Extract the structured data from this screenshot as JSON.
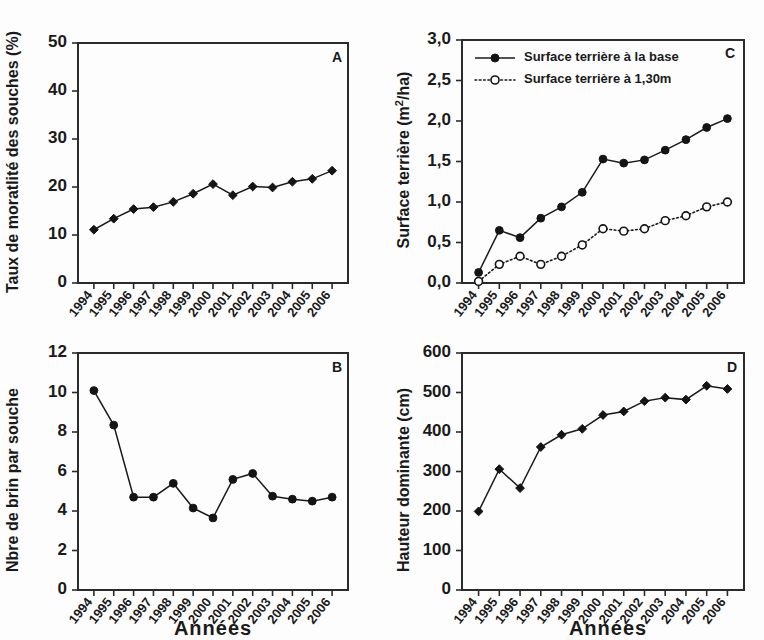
{
  "figure": {
    "width": 764,
    "height": 640,
    "background": "#ffffff",
    "ink_color": "#1a1a1a",
    "xaxis_title": "Années",
    "xaxis_title_2": "Années"
  },
  "chart_data": [
    {
      "id": "A",
      "panel_letter": "A",
      "type": "line",
      "title": "",
      "xlabel": "Années",
      "ylabel": "Taux de moratlité des souches (%)",
      "x": [
        "1994",
        "1995",
        "1996",
        "1997",
        "1998",
        "1999",
        "2000",
        "2001",
        "2002",
        "2003",
        "2004",
        "2005",
        "2006"
      ],
      "categories": [
        "1994",
        "1995",
        "1996",
        "1997",
        "1998",
        "1999",
        "2000",
        "2001",
        "2002",
        "2003",
        "2004",
        "2005",
        "2006"
      ],
      "values": [
        11.1,
        13.4,
        15.4,
        15.8,
        16.9,
        18.6,
        20.6,
        18.3,
        20.1,
        19.9,
        21.1,
        21.7,
        23.4
      ],
      "ylim": [
        0,
        50
      ],
      "yticks": [
        0,
        10,
        20,
        30,
        40,
        50
      ],
      "ytick_labels": [
        "0",
        "10",
        "20",
        "30",
        "40",
        "50"
      ],
      "grid": false,
      "legend": null,
      "marker": "filled-diamond",
      "linestyle": "solid"
    },
    {
      "id": "B",
      "panel_letter": "B",
      "type": "line",
      "title": "",
      "xlabel": "Années",
      "ylabel": "Nbre de brin par souche",
      "x": [
        "1994",
        "1995",
        "1996",
        "1997",
        "1998",
        "1999",
        "2000",
        "2001",
        "2002",
        "2003",
        "2004",
        "2005",
        "2006"
      ],
      "categories": [
        "1994",
        "1995",
        "1996",
        "1997",
        "1998",
        "1999",
        "2000",
        "2001",
        "2002",
        "2003",
        "2004",
        "2005",
        "2006"
      ],
      "values": [
        10.1,
        8.35,
        4.7,
        4.7,
        5.4,
        4.15,
        3.65,
        5.6,
        5.9,
        4.75,
        4.6,
        4.5,
        4.7
      ],
      "ylim": [
        0,
        12
      ],
      "yticks": [
        0,
        2,
        4,
        6,
        8,
        10,
        12
      ],
      "ytick_labels": [
        "0",
        "2",
        "4",
        "6",
        "8",
        "10",
        "12"
      ],
      "grid": false,
      "legend": null,
      "marker": "filled-circle",
      "linestyle": "solid"
    },
    {
      "id": "C",
      "panel_letter": "C",
      "type": "line",
      "title": "",
      "xlabel": "Années",
      "ylabel": "Surface terrière (m²/ha)",
      "ylabel_parts": {
        "pre": "Surface terrière (m",
        "sup": "2",
        "post": "/ha)"
      },
      "x": [
        "1994",
        "1995",
        "1996",
        "1997",
        "1998",
        "1999",
        "2000",
        "2001",
        "2002",
        "2003",
        "2004",
        "2005",
        "2006"
      ],
      "categories": [
        "1994",
        "1995",
        "1996",
        "1997",
        "1998",
        "1999",
        "2000",
        "2001",
        "2002",
        "2003",
        "2004",
        "2005",
        "2006"
      ],
      "series": [
        {
          "name": "Surface terrière à la base",
          "marker": "filled-circle",
          "linestyle": "solid",
          "values": [
            0.13,
            0.65,
            0.56,
            0.8,
            0.94,
            1.12,
            1.53,
            1.48,
            1.52,
            1.64,
            1.77,
            1.92,
            2.03
          ]
        },
        {
          "name": "Surface terrière à 1,30m",
          "marker": "open-circle",
          "linestyle": "dotted",
          "values": [
            0.02,
            0.23,
            0.33,
            0.23,
            0.33,
            0.47,
            0.67,
            0.64,
            0.67,
            0.77,
            0.83,
            0.94,
            1.0
          ]
        }
      ],
      "ylim": [
        0,
        3.0
      ],
      "yticks": [
        0,
        0.5,
        1.0,
        1.5,
        2.0,
        2.5,
        3.0
      ],
      "ytick_labels": [
        "0,0",
        "0,5",
        "1,0",
        "1,5",
        "2,0",
        "2,5",
        "3,0"
      ],
      "grid": false,
      "legend": {
        "position": "top-left-inside",
        "entries": [
          "Surface terrière à la base",
          "Surface terrière à 1,30m"
        ]
      }
    },
    {
      "id": "D",
      "panel_letter": "D",
      "type": "line",
      "title": "",
      "xlabel": "Années",
      "ylabel": "Hauteur dominante (cm)",
      "x": [
        "1994",
        "1995",
        "1996",
        "1997",
        "1998",
        "1999",
        "2000",
        "2001",
        "2002",
        "2003",
        "2004",
        "2005",
        "2006"
      ],
      "categories": [
        "1994",
        "1995",
        "1996",
        "1997",
        "1998",
        "1999",
        "2000",
        "2001",
        "2002",
        "2003",
        "2004",
        "2005",
        "2006"
      ],
      "values": [
        199,
        306,
        258,
        362,
        393,
        408,
        443,
        452,
        478,
        487,
        482,
        517,
        509
      ],
      "ylim": [
        0,
        600
      ],
      "yticks": [
        0,
        100,
        200,
        300,
        400,
        500,
        600
      ],
      "ytick_labels": [
        "0",
        "100",
        "200",
        "300",
        "400",
        "500",
        "600"
      ],
      "grid": false,
      "legend": null,
      "marker": "filled-diamond",
      "linestyle": "solid"
    }
  ]
}
